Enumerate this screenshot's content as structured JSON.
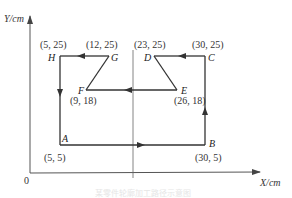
{
  "axes": {
    "y_label": "Y/cm",
    "x_label": "X/cm",
    "origin_label": "0"
  },
  "points": [
    {
      "name": "A",
      "coord": "(5, 5)"
    },
    {
      "name": "B",
      "coord": "(30, 5)"
    },
    {
      "name": "C",
      "coord": "(30, 25)"
    },
    {
      "name": "D",
      "coord": "(23, 25)"
    },
    {
      "name": "E",
      "coord": "(26, 18)"
    },
    {
      "name": "F",
      "coord": "(9, 18)"
    },
    {
      "name": "G",
      "coord": "(12, 25)"
    },
    {
      "name": "H",
      "coord": "(5, 25)"
    }
  ],
  "path_order": [
    "A",
    "B",
    "C",
    "D",
    "E",
    "F",
    "G",
    "H",
    "A"
  ],
  "caption": "某零件轮廓加工路径示意图",
  "colors": {
    "line": "#333333",
    "background": "#ffffff"
  }
}
